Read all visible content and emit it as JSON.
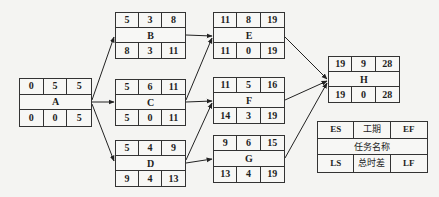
{
  "diagram": {
    "type": "activity-on-node network (critical path)",
    "nodes": {
      "A": {
        "name": "A",
        "es": "0",
        "dur": "5",
        "ef": "5",
        "ls": "0",
        "tf": "0",
        "lf": "5"
      },
      "B": {
        "name": "B",
        "es": "5",
        "dur": "3",
        "ef": "8",
        "ls": "8",
        "tf": "3",
        "lf": "11"
      },
      "C": {
        "name": "C",
        "es": "5",
        "dur": "6",
        "ef": "11",
        "ls": "5",
        "tf": "0",
        "lf": "11"
      },
      "D": {
        "name": "D",
        "es": "5",
        "dur": "4",
        "ef": "9",
        "ls": "9",
        "tf": "4",
        "lf": "13"
      },
      "E": {
        "name": "E",
        "es": "11",
        "dur": "8",
        "ef": "19",
        "ls": "11",
        "tf": "0",
        "lf": "19"
      },
      "F": {
        "name": "F",
        "es": "11",
        "dur": "5",
        "ef": "16",
        "ls": "14",
        "tf": "3",
        "lf": "19"
      },
      "G": {
        "name": "G",
        "es": "9",
        "dur": "6",
        "ef": "15",
        "ls": "13",
        "tf": "4",
        "lf": "19"
      },
      "H": {
        "name": "H",
        "es": "19",
        "dur": "9",
        "ef": "28",
        "ls": "19",
        "tf": "0",
        "lf": "28"
      }
    },
    "edges": [
      [
        "A",
        "B"
      ],
      [
        "A",
        "C"
      ],
      [
        "A",
        "D"
      ],
      [
        "B",
        "E"
      ],
      [
        "C",
        "E"
      ],
      [
        "C",
        "F"
      ],
      [
        "D",
        "F"
      ],
      [
        "D",
        "G"
      ],
      [
        "E",
        "H"
      ],
      [
        "F",
        "H"
      ],
      [
        "G",
        "H"
      ]
    ],
    "legend": {
      "es": "ES",
      "dur": "工期",
      "ef": "EF",
      "name": "任务名称",
      "ls": "LS",
      "tf": "总时差",
      "lf": "LF"
    }
  }
}
